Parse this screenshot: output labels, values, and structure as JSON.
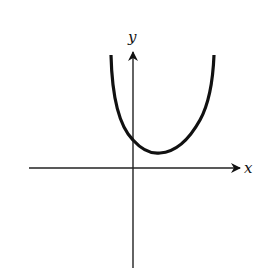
{
  "diagram": {
    "type": "function-graph",
    "axes": {
      "x_label": "x",
      "y_label": "y"
    },
    "curve": {
      "shape": "U-shaped (concave up)",
      "min_location": "first quadrant, right of y-axis, above x-axis",
      "y_intercept": "positive",
      "x_intercepts": "none"
    },
    "colors": {
      "stroke": "#111111",
      "background": "#ffffff"
    }
  }
}
